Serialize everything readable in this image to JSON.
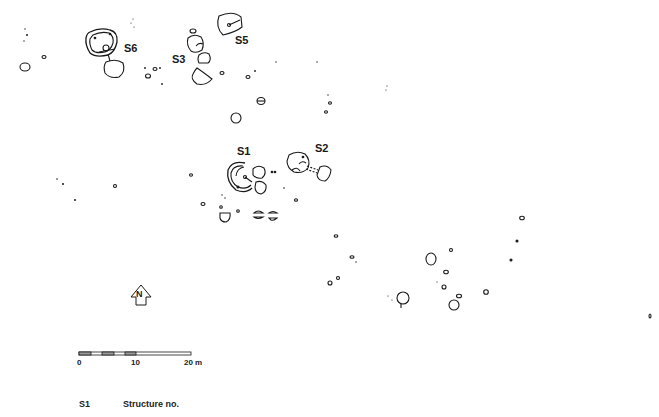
{
  "plan": {
    "structures": [
      {
        "id": "S1",
        "label": "S1"
      },
      {
        "id": "S2",
        "label": "S2"
      },
      {
        "id": "S3",
        "label": "S3"
      },
      {
        "id": "S5",
        "label": "S5"
      },
      {
        "id": "S6",
        "label": "S6"
      }
    ],
    "north_arrow": {
      "label": "N"
    },
    "scale_bar": {
      "ticks": [
        "0",
        "10",
        "20 m"
      ]
    },
    "legend": {
      "key": "S1",
      "description": "Structure no."
    }
  }
}
